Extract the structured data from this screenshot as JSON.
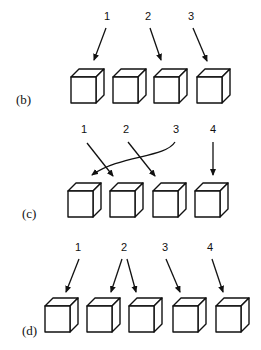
{
  "panels": [
    {
      "id": "b",
      "label": "(b)",
      "label_pos": [
        16,
        104
      ],
      "cubes": [
        [
          71,
          77
        ],
        [
          113,
          77
        ],
        [
          154,
          77
        ],
        [
          197,
          77
        ]
      ],
      "pointers": [
        {
          "text": "1",
          "pos": [
            104,
            20
          ],
          "arrows": [
            [
              [
                106,
                28
              ],
              [
                94,
                60
              ]
            ]
          ]
        },
        {
          "text": "2",
          "pos": [
            145,
            20
          ],
          "arrows": [
            [
              [
                150,
                28
              ],
              [
                161,
                60
              ]
            ]
          ]
        },
        {
          "text": "3",
          "pos": [
            188,
            20
          ],
          "arrows": [
            [
              [
                193,
                28
              ],
              [
                207,
                61
              ]
            ]
          ]
        }
      ]
    },
    {
      "id": "c",
      "label": "(c)",
      "label_pos": [
        22,
        218
      ],
      "cubes": [
        [
          68,
          191
        ],
        [
          110,
          191
        ],
        [
          153,
          191
        ],
        [
          195,
          191
        ]
      ],
      "pointers": [
        {
          "text": "1",
          "pos": [
            81,
            133
          ],
          "arrows": [
            [
              [
                87,
                143
              ],
              [
                113,
                176
              ]
            ]
          ]
        },
        {
          "text": "2",
          "pos": [
            123,
            133
          ],
          "arrows": [
            [
              [
                128,
                142
              ],
              [
                155,
                176
              ]
            ]
          ]
        },
        {
          "text": "3",
          "pos": [
            173,
            133
          ],
          "curve": "M175,142 C165,158 120,155 92,175"
        },
        {
          "text": "4",
          "pos": [
            210,
            133
          ],
          "arrows": [
            [
              [
                213,
                142
              ],
              [
                213,
                175
              ]
            ]
          ]
        }
      ]
    },
    {
      "id": "d",
      "label": "(d)",
      "label_pos": [
        22,
        335
      ],
      "cubes": [
        [
          45,
          306
        ],
        [
          87,
          306
        ],
        [
          129,
          306
        ],
        [
          173,
          306
        ],
        [
          216,
          306
        ]
      ],
      "pointers": [
        {
          "text": "1",
          "pos": [
            75,
            251
          ],
          "arrows": [
            [
              [
                79,
                259
              ],
              [
                66,
                292
              ]
            ]
          ]
        },
        {
          "text": "2",
          "pos": [
            121,
            251
          ],
          "arrows": [
            [
              [
                122,
                259
              ],
              [
                111,
                292
              ]
            ],
            [
              [
                127,
                259
              ],
              [
                136,
                292
              ]
            ]
          ]
        },
        {
          "text": "3",
          "pos": [
            162,
            251
          ],
          "arrows": [
            [
              [
                166,
                259
              ],
              [
                180,
                292
              ]
            ]
          ]
        },
        {
          "text": "4",
          "pos": [
            207,
            251
          ],
          "arrows": [
            [
              [
                212,
                259
              ],
              [
                223,
                292
              ]
            ]
          ]
        }
      ]
    }
  ],
  "cube_size": {
    "w": 25,
    "h": 26,
    "depth": 8
  }
}
